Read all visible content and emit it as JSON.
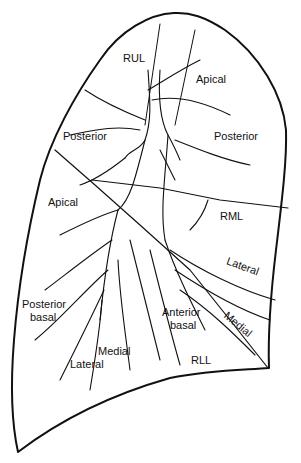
{
  "diagram": {
    "lobes": {
      "upper": "RUL",
      "middle": "RML",
      "lower": "RLL"
    },
    "upper_lobe_segments": [
      "Apical",
      "Posterior",
      "Posterior"
    ],
    "lower_lobe_apical": "Apical",
    "middle_lobe_segments": [
      "Lateral",
      "Medial"
    ],
    "lower_lobe_basal_segments": {
      "posterior_basal_1": "Posterior",
      "posterior_basal_2": "basal",
      "anterior_basal_1": "Anterior",
      "anterior_basal_2": "basal",
      "lateral": "Lateral",
      "medial": "Medial"
    },
    "colors": {
      "line": "#111111",
      "background": "#ffffff"
    }
  }
}
